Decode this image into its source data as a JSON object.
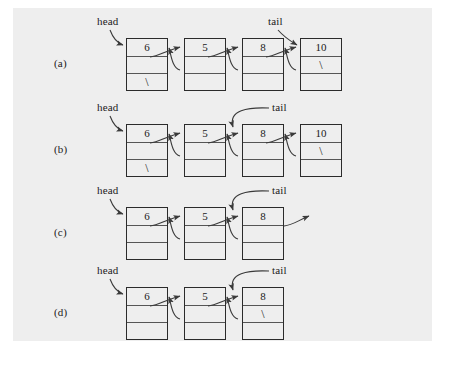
{
  "figure": {
    "type": "doubly-linked-list-diagram",
    "background_color": "#eeeeee",
    "page_color": "#ffffff",
    "node_border_color": "#2b2b2b",
    "line_color": "#3a3a3a",
    "null_symbol": "\\",
    "pointer_labels": {
      "head": "head",
      "tail": "tail"
    },
    "rows": [
      {
        "label": "(a)",
        "nodes": [
          {
            "value": "6",
            "next": "",
            "prev": "\\"
          },
          {
            "value": "5",
            "next": "",
            "prev": ""
          },
          {
            "value": "8",
            "next": "",
            "prev": ""
          },
          {
            "value": "10",
            "next": "\\",
            "prev": ""
          }
        ],
        "head_target_index": 0,
        "tail_target_index": 3,
        "dangling_next_from_index": null
      },
      {
        "label": "(b)",
        "nodes": [
          {
            "value": "6",
            "next": "",
            "prev": "\\"
          },
          {
            "value": "5",
            "next": "",
            "prev": ""
          },
          {
            "value": "8",
            "next": "",
            "prev": ""
          },
          {
            "value": "10",
            "next": "\\",
            "prev": ""
          }
        ],
        "head_target_index": 0,
        "tail_target_index": 2,
        "dangling_next_from_index": null
      },
      {
        "label": "(c)",
        "nodes": [
          {
            "value": "6",
            "next": "",
            "prev": ""
          },
          {
            "value": "5",
            "next": "",
            "prev": ""
          },
          {
            "value": "8",
            "next": "",
            "prev": ""
          }
        ],
        "head_target_index": 0,
        "tail_target_index": 2,
        "dangling_next_from_index": 2
      },
      {
        "label": "(d)",
        "nodes": [
          {
            "value": "6",
            "next": "",
            "prev": ""
          },
          {
            "value": "5",
            "next": "",
            "prev": ""
          },
          {
            "value": "8",
            "next": "\\",
            "prev": ""
          }
        ],
        "head_target_index": 0,
        "tail_target_index": 2,
        "dangling_next_from_index": null
      }
    ]
  }
}
